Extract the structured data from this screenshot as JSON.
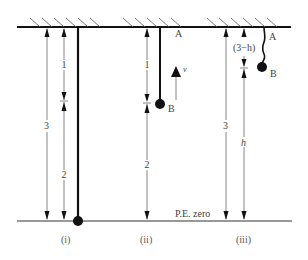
{
  "diagram": {
    "ceiling_label": "A",
    "floor_label": "P.E. zero",
    "panels": [
      {
        "caption": "(i)",
        "dim_total": "3",
        "dim_upper": "1",
        "dim_lower": "2"
      },
      {
        "caption": "(ii)",
        "point_a": "A",
        "point_b": "B",
        "velocity": "v",
        "dim_upper": "1",
        "dim_lower": "2"
      },
      {
        "caption": "(iii)",
        "point_a": "A",
        "point_b": "B",
        "dim_total": "3",
        "dim_upper": "(3−h)",
        "dim_lower": "h"
      }
    ],
    "colors": {
      "line": "#111111",
      "dimension": "#666666",
      "text": "#444444"
    }
  }
}
